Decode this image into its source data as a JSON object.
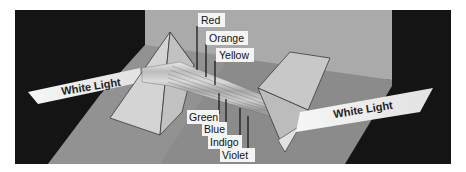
{
  "beams": {
    "input_label": "White Light",
    "output_label": "White Light"
  },
  "spectrum_labels": [
    {
      "name": "Red"
    },
    {
      "name": "Orange"
    },
    {
      "name": "Yellow"
    },
    {
      "name": "Green"
    },
    {
      "name": "Blue"
    },
    {
      "name": "Indigo"
    },
    {
      "name": "Violet"
    }
  ],
  "colors": {
    "background_dark": "#141414",
    "wall": "#a9a9a9",
    "floor": "#8a8a8a",
    "label_box": "#f4f4f4",
    "beam": "#eeeeee",
    "prism_face_light": "#cfcfcf",
    "prism_edge": "#3a3a3a"
  }
}
